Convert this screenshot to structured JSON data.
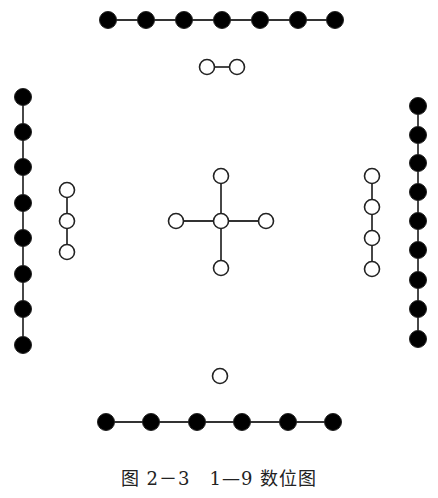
{
  "figure": {
    "caption": "图 2－3　1—9 数位图",
    "style": {
      "black_fill": "#000000",
      "white_fill": "#ffffff",
      "stroke": "#222222",
      "line_color": "#333333",
      "dot_radius": 8
    },
    "groups": [
      {
        "name": "top-black-7",
        "number": 7,
        "color": "black",
        "orientation": "horizontal",
        "connected": true,
        "points": [
          [
            108,
            20
          ],
          [
            146,
            20
          ],
          [
            184,
            20
          ],
          [
            222,
            20
          ],
          [
            260,
            20
          ],
          [
            298,
            20
          ],
          [
            335,
            20
          ]
        ]
      },
      {
        "name": "top-white-2",
        "number": 2,
        "color": "white",
        "orientation": "horizontal",
        "connected": true,
        "points": [
          [
            207,
            67
          ],
          [
            237,
            67
          ]
        ]
      },
      {
        "name": "left-black-8",
        "number": 8,
        "color": "black",
        "orientation": "vertical",
        "connected": true,
        "points": [
          [
            23,
            97
          ],
          [
            23,
            132
          ],
          [
            23,
            167
          ],
          [
            23,
            203
          ],
          [
            23,
            238
          ],
          [
            23,
            274
          ],
          [
            23,
            309
          ],
          [
            23,
            345
          ]
        ]
      },
      {
        "name": "left-white-3",
        "number": 3,
        "color": "white",
        "orientation": "vertical",
        "connected": true,
        "points": [
          [
            67,
            190
          ],
          [
            67,
            221
          ],
          [
            67,
            252
          ]
        ]
      },
      {
        "name": "center-white-5",
        "number": 5,
        "color": "white",
        "orientation": "cross",
        "connected": true,
        "center": [
          221,
          221
        ],
        "points": [
          [
            221,
            176
          ],
          [
            176,
            221
          ],
          [
            221,
            221
          ],
          [
            266,
            221
          ],
          [
            221,
            268
          ]
        ]
      },
      {
        "name": "right-white-4",
        "number": 4,
        "color": "white",
        "orientation": "vertical",
        "connected": true,
        "points": [
          [
            372,
            176
          ],
          [
            372,
            207
          ],
          [
            372,
            238
          ],
          [
            372,
            269
          ]
        ]
      },
      {
        "name": "right-black-9",
        "number": 9,
        "color": "black",
        "orientation": "vertical",
        "connected": true,
        "points": [
          [
            418,
            106
          ],
          [
            418,
            135
          ],
          [
            418,
            163
          ],
          [
            418,
            192
          ],
          [
            418,
            221
          ],
          [
            418,
            250
          ],
          [
            418,
            280
          ],
          [
            418,
            309
          ],
          [
            418,
            339
          ]
        ]
      },
      {
        "name": "bottom-white-1",
        "number": 1,
        "color": "white",
        "orientation": "single",
        "connected": false,
        "points": [
          [
            220,
            376
          ]
        ]
      },
      {
        "name": "bottom-black-6",
        "number": 6,
        "color": "black",
        "orientation": "horizontal",
        "connected": true,
        "points": [
          [
            106,
            422
          ],
          [
            151,
            422
          ],
          [
            197,
            422
          ],
          [
            242,
            422
          ],
          [
            288,
            422
          ],
          [
            333,
            422
          ]
        ]
      }
    ]
  }
}
